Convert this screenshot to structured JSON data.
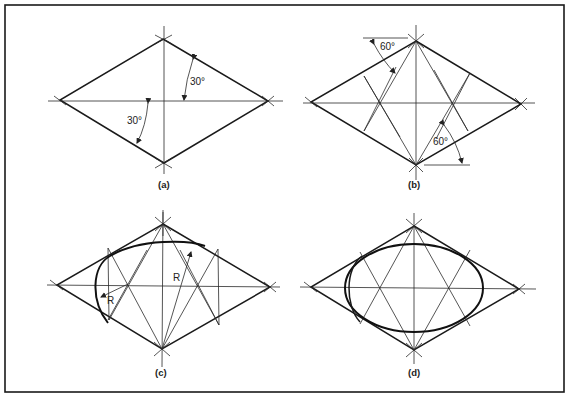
{
  "figure": {
    "panels": [
      {
        "id": "a",
        "caption": "(a)",
        "annotations": [
          "30°",
          "30°"
        ]
      },
      {
        "id": "b",
        "caption": "(b)",
        "annotations": [
          "60°",
          "60°"
        ]
      },
      {
        "id": "c",
        "caption": "(c)",
        "annotations": [
          "R",
          "R"
        ]
      },
      {
        "id": "d",
        "caption": "(d)",
        "annotations": []
      }
    ]
  }
}
